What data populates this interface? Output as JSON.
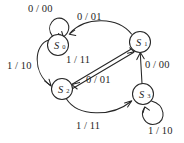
{
  "diagram": {
    "kind": "finite-state-machine",
    "background_color": "#ffffff",
    "line_color": "#262626",
    "states": [
      {
        "id": "S0",
        "label": "S",
        "subscript": "0",
        "cx": 58,
        "cy": 45,
        "r": 10.5
      },
      {
        "id": "S1",
        "label": "S",
        "subscript": "1",
        "cx": 140,
        "cy": 42,
        "r": 10.5
      },
      {
        "id": "S2",
        "label": "S",
        "subscript": "2",
        "cx": 62,
        "cy": 89,
        "r": 10.5
      },
      {
        "id": "S3",
        "label": "S",
        "subscript": "3",
        "cx": 143,
        "cy": 94,
        "r": 10.5
      }
    ],
    "transitions": [
      {
        "id": "t-s0-s0",
        "from": "S0",
        "to": "S0",
        "label": "0 / 00",
        "kind": "self-loop"
      },
      {
        "id": "t-s1-s0",
        "from": "S1",
        "to": "S0",
        "label": "0 / 01",
        "kind": "arc-top"
      },
      {
        "id": "t-s0-s2",
        "from": "S0",
        "to": "S2",
        "label": "1 / 10",
        "kind": "arc-left"
      },
      {
        "id": "t-s1-s2",
        "from": "S1",
        "to": "S2",
        "label": "1 / 11",
        "kind": "diagonal"
      },
      {
        "id": "t-s2-s1",
        "from": "S2",
        "to": "S1",
        "label": "0 / 01",
        "kind": "diagonal"
      },
      {
        "id": "t-s3-s1",
        "from": "S3",
        "to": "S1",
        "label": "0 / 00",
        "kind": "vertical"
      },
      {
        "id": "t-s2-s3",
        "from": "S2",
        "to": "S3",
        "label": "1 / 11",
        "kind": "arc-bottom"
      },
      {
        "id": "t-s3-s3",
        "from": "S3",
        "to": "S3",
        "label": "1 / 10",
        "kind": "self-loop"
      }
    ],
    "labels": {
      "s0_self": "0 / 00",
      "top_arc": "0 / 01",
      "left_arc": "1 / 10",
      "diag_upper": "1 / 11",
      "diag_lower": "0 / 01",
      "right_vertical": "0 / 00",
      "bottom_arc": "1 / 11",
      "s3_self": "1 / 10"
    }
  }
}
